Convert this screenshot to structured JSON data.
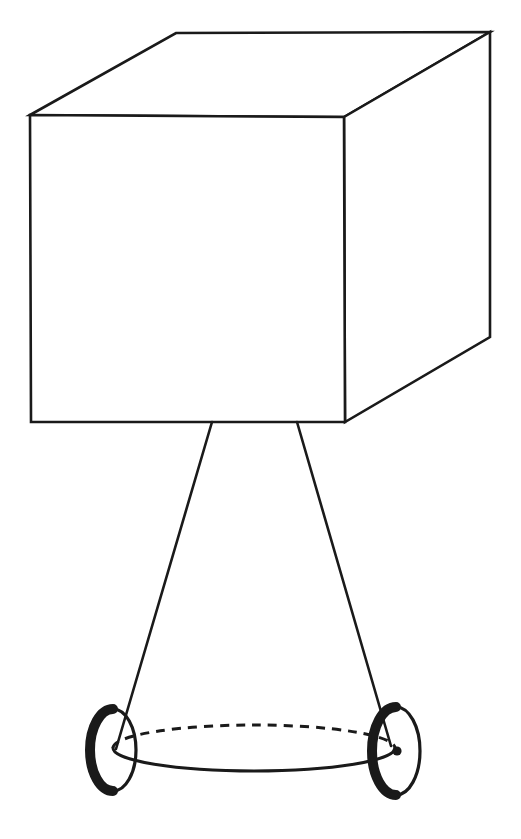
{
  "figure": {
    "title": "Line drawing of a box on a two-wheeled axle",
    "caption": "",
    "background_color": "#ffffff",
    "stroke_color": "#1a1a1a",
    "fill_color": "#ffffff",
    "canvas": {
      "width": 521,
      "height": 839
    },
    "parts": {
      "box": {
        "name": "cube-box",
        "stroke_width": 2.6,
        "front_face": {
          "label": "front-face",
          "points": "30,115 344,117 345,422 31,422"
        },
        "top_face": {
          "label": "top-face",
          "points": "30,115 176,33 490,32 344,117"
        },
        "right_face": {
          "label": "right-face",
          "points": "344,117 490,32 490,337 345,422"
        }
      },
      "legs": {
        "name": "support-legs",
        "stroke_width": 2.6,
        "items": [
          {
            "label": "left-leg",
            "x1": 212,
            "y1": 422,
            "x2": 116,
            "y2": 749
          },
          {
            "label": "right-leg",
            "x1": 297,
            "y1": 422,
            "x2": 391,
            "y2": 746
          }
        ]
      },
      "axle": {
        "name": "axle-ellipse",
        "center_x": 254,
        "center_y": 748,
        "radius_x": 141,
        "radius_y": 23,
        "stroke_width": 3.0,
        "dash_pattern": "9 7",
        "back_arc_style": "dashed",
        "front_arc_style": "solid"
      },
      "wheels": [
        {
          "label": "left-wheel",
          "center_x": 113,
          "center_y": 750,
          "radius_x": 23,
          "radius_y": 41,
          "rim_stroke_width": 3.2,
          "tire_stroke_width": 10,
          "tire_arc_side": "left",
          "hub": {
            "visible": false,
            "radius": 0
          }
        },
        {
          "label": "right-wheel",
          "center_x": 396,
          "center_y": 751,
          "radius_x": 24,
          "radius_y": 44,
          "rim_stroke_width": 3.2,
          "tire_stroke_width": 10,
          "tire_arc_side": "left",
          "hub": {
            "visible": true,
            "radius": 4.6,
            "center_x": 397,
            "center_y": 751
          }
        }
      ]
    }
  }
}
